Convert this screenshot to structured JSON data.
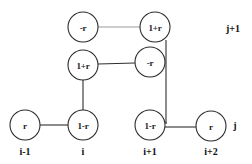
{
  "diagram": {
    "type": "lattice-node-graph",
    "background_color": "#ffffff",
    "stroke_color": "#2f2f2f",
    "faded_stroke_color": "#9a9a9a",
    "node_fill": "#ffffff",
    "node_radius": 15,
    "nodes": [
      {
        "id": "n-bottom-i-minus-1",
        "label": "r",
        "cx": 25,
        "cy": 125,
        "row": "j",
        "column": "i-1"
      },
      {
        "id": "n-bottom-i",
        "label": "1-r",
        "cx": 83,
        "cy": 125,
        "row": "j",
        "column": "i"
      },
      {
        "id": "n-bottom-i-plus-1",
        "label": "1-r",
        "cx": 150,
        "cy": 125,
        "row": "j",
        "column": "i+1"
      },
      {
        "id": "n-bottom-i-plus-2",
        "label": "r",
        "cx": 211,
        "cy": 125,
        "row": "j",
        "column": "i+2"
      },
      {
        "id": "n-middle-i",
        "label": "1+r",
        "cx": 83,
        "cy": 65,
        "row": "mid",
        "column": "i"
      },
      {
        "id": "n-middle-i-plus-1",
        "label": "-r",
        "cx": 150,
        "cy": 62,
        "row": "mid",
        "column": "i+1"
      },
      {
        "id": "n-top-i",
        "label": "-r",
        "cx": 83,
        "cy": 27,
        "row": "j+1",
        "column": "i"
      },
      {
        "id": "n-top-i-plus-1",
        "label": "1+r",
        "cx": 155,
        "cy": 27,
        "row": "j+1",
        "column": "i+1"
      }
    ],
    "edges": [
      {
        "id": "e-top-horizontal",
        "from": "n-top-i",
        "to": "n-top-i-plus-1",
        "style": "faded",
        "x1": 98,
        "y1": 27,
        "x2": 140,
        "y2": 27
      },
      {
        "id": "e-middle-horizontal",
        "from": "n-middle-i",
        "to": "n-middle-i-plus-1",
        "style": "solid",
        "x1": 98,
        "y1": 64,
        "x2": 135,
        "y2": 63
      },
      {
        "id": "e-left-vertical",
        "from": "n-middle-i",
        "to": "n-bottom-i",
        "style": "solid",
        "x1": 83,
        "y1": 80,
        "x2": 83,
        "y2": 110
      },
      {
        "id": "e-right-vertical",
        "from": "n-top-i-plus-1",
        "to": "n-bottom-i-plus-1",
        "style": "solid",
        "x1": 166,
        "y1": 40,
        "x2": 166,
        "y2": 122
      },
      {
        "id": "e-right-vertical-lower",
        "from": "n-bottom-i-plus-1",
        "to": "n-right-vertical-joint",
        "style": "solid",
        "x1": 150,
        "y1": 122,
        "x2": 166,
        "y2": 122
      },
      {
        "id": "e-bottom-left",
        "from": "n-bottom-i-minus-1",
        "to": "n-bottom-i",
        "style": "solid",
        "x1": 40,
        "y1": 125,
        "x2": 68,
        "y2": 125
      },
      {
        "id": "e-bottom-right",
        "from": "n-bottom-i-plus-1",
        "to": "n-bottom-i-plus-2",
        "style": "solid",
        "x1": 165,
        "y1": 127,
        "x2": 196,
        "y2": 127
      }
    ],
    "row_labels": [
      {
        "id": "row-label-j-plus-1",
        "text": "j+1",
        "x": 233,
        "y": 28
      },
      {
        "id": "row-label-j",
        "text": "j",
        "x": 235,
        "y": 125
      }
    ],
    "column_labels": [
      {
        "id": "col-label-i-minus-1",
        "text": "i-1",
        "x": 25,
        "y": 151
      },
      {
        "id": "col-label-i",
        "text": "i",
        "x": 83,
        "y": 151
      },
      {
        "id": "col-label-i-plus-1",
        "text": "i+1",
        "x": 150,
        "y": 151
      },
      {
        "id": "col-label-i-plus-2",
        "text": "i+2",
        "x": 211,
        "y": 151
      }
    ]
  }
}
